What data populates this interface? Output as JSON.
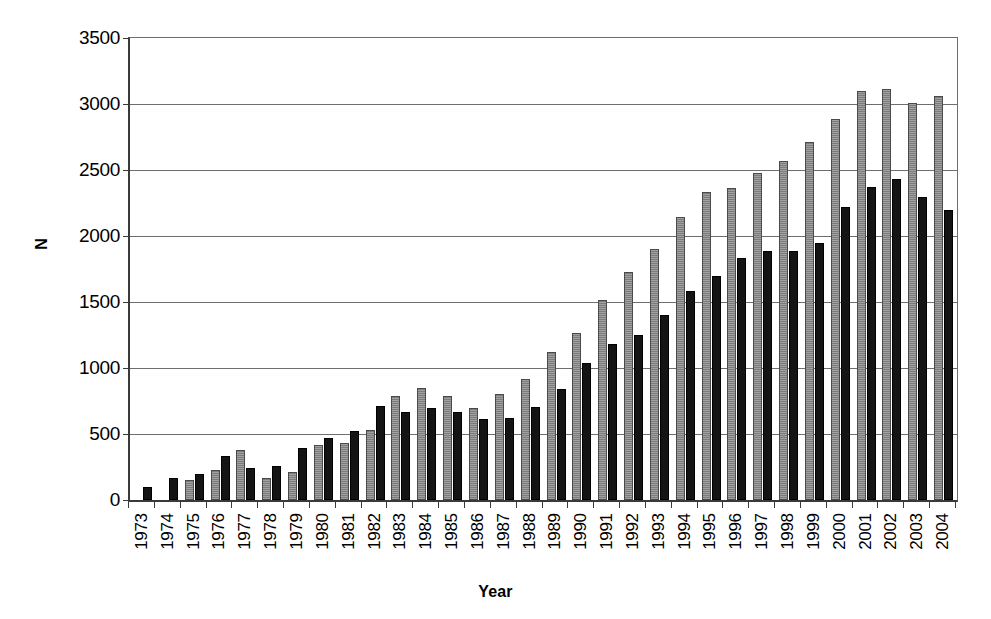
{
  "chart_data": {
    "type": "bar",
    "title": "",
    "xlabel": "Year",
    "ylabel": "N",
    "ylim": [
      0,
      3500
    ],
    "ytick_step": 500,
    "yticks": [
      3500,
      3000,
      2500,
      2000,
      1500,
      1000,
      500,
      0
    ],
    "ytick_labels": [
      "3500",
      "3000",
      "2500",
      "2000",
      "1500",
      "1000",
      "500",
      "0"
    ],
    "grid": true,
    "legend": "none",
    "categories": [
      "1973",
      "1974",
      "1975",
      "1976",
      "1977",
      "1978",
      "1979",
      "1980",
      "1981",
      "1982",
      "1983",
      "1984",
      "1985",
      "1986",
      "1987",
      "1988",
      "1989",
      "1990",
      "1991",
      "1992",
      "1993",
      "1994",
      "1995",
      "1996",
      "1997",
      "1998",
      "1999",
      "2000",
      "2001",
      "2002",
      "2003",
      "2004"
    ],
    "series": [
      {
        "name": "gray",
        "color": "#8a8a8a",
        "values": [
          null,
          null,
          150,
          230,
          380,
          165,
          215,
          420,
          435,
          530,
          790,
          845,
          790,
          700,
          800,
          915,
          1120,
          1265,
          1515,
          1730,
          1905,
          2145,
          2330,
          2365,
          2480,
          2570,
          2715,
          2885,
          3100,
          3115,
          3005,
          3060
        ]
      },
      {
        "name": "black",
        "color": "#141414",
        "values": [
          95,
          165,
          195,
          330,
          240,
          260,
          395,
          470,
          520,
          715,
          665,
          700,
          670,
          610,
          625,
          705,
          840,
          1040,
          1180,
          1250,
          1400,
          1585,
          1700,
          1830,
          1885,
          1890,
          1945,
          2220,
          2370,
          2430,
          2295,
          2200
        ]
      }
    ]
  }
}
